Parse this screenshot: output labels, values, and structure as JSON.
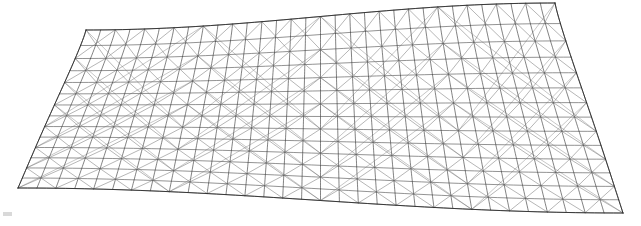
{
  "figure": {
    "kind": "wireframe-3d-mesh",
    "background_color": "#ffffff",
    "canvas": {
      "width": 641,
      "height": 226
    }
  },
  "chart_data": {
    "type": "line",
    "xlabel": "",
    "ylabel": "",
    "grid": false,
    "legend": null,
    "surface": {
      "name": "hyperbolic-paraboloid-gridshell",
      "u_divisions": 32,
      "v_divisions": 14,
      "description": "Anticlastic saddle surface drawn as a quad lattice with diagonal cross bracing, viewed slightly from below and in front."
    },
    "projection": {
      "center_x": 320.5,
      "top_crest_y": 3,
      "top_valley_y": 30,
      "bottom_crest_y": 213,
      "bottom_valley_y": 188,
      "left_top_x": 86,
      "right_top_x": 555,
      "left_bottom_x": 18,
      "right_bottom_x": 623,
      "perspective_bulge": 0.42
    },
    "categories": [
      "ring-0",
      "ring-1",
      "ring-2",
      "ring-3",
      "ring-4",
      "ring-5",
      "ring-6",
      "ring-7",
      "ring-8",
      "ring-9",
      "ring-10",
      "ring-11",
      "ring-12",
      "ring-13",
      "ring-14"
    ],
    "values": [
      0,
      1,
      2,
      3,
      4,
      5,
      6,
      7,
      8,
      9,
      10,
      11,
      12,
      13,
      14
    ],
    "series": [
      {
        "name": "horizontal-rings",
        "count": 15,
        "stroke": "#3a3a3a",
        "width": 0.6
      },
      {
        "name": "vertical-meridians",
        "count": 33,
        "stroke": "#2e2e2e",
        "width": 0.6
      },
      {
        "name": "diagonal-bracing-right",
        "count": 16,
        "stroke": "#4a4a4a",
        "width": 0.55
      },
      {
        "name": "diagonal-bracing-left",
        "count": 16,
        "stroke": "#4a4a4a",
        "width": 0.55
      },
      {
        "name": "boundary-edges",
        "count": 4,
        "stroke": "#2a2a2a",
        "width": 0.8
      }
    ],
    "ylim": [
      0,
      14
    ],
    "xlim": [
      0,
      32
    ]
  },
  "style": {
    "line_color": "#3a3a3a",
    "line_color_dark": "#222222",
    "line_color_light": "#6a6a6a",
    "line_width": 0.6,
    "background": "#ffffff"
  },
  "artifacts": {
    "corner_mark_label": "faint gray artifact mark"
  }
}
